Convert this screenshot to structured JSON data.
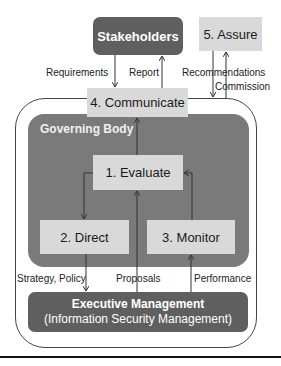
{
  "diagram": {
    "stakeholders": "Stakeholders",
    "assure": "5. Assure",
    "communicate": "4. Communicate",
    "governing_body": "Governing Body",
    "evaluate": "1. Evaluate",
    "direct": "2. Direct",
    "monitor": "3. Monitor",
    "executive_title": "Executive Management",
    "executive_subtitle": "(Information Security Management)",
    "flows": {
      "requirements": "Requirements",
      "report": "Report",
      "recommendations": "Recommendations",
      "commission": "Commission",
      "strategy_policy": "Strategy, Policy",
      "proposals": "Proposals",
      "performance": "Performance"
    }
  },
  "colors": {
    "dark_fill": "#5f5f5f",
    "governing_fill": "#7a7a7a",
    "light_fill": "#d9d9d9",
    "line": "#333333"
  }
}
